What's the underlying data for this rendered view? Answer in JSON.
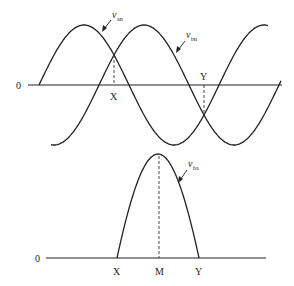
{
  "top_plot": {
    "zero_label": "0",
    "curves": [
      {
        "name": "v_an",
        "symbol": "v",
        "subscript": "an",
        "phase_deg": 0
      },
      {
        "name": "v_bn",
        "symbol": "v",
        "subscript": "bn",
        "phase_deg": -120
      }
    ],
    "markers": [
      {
        "label": "X",
        "description": "intersection of v_an and v_bn above axis"
      },
      {
        "label": "Y",
        "description": "intersection of v_an and v_bn below axis"
      }
    ]
  },
  "bottom_plot": {
    "zero_label": "0",
    "curve": {
      "name": "v_ba",
      "symbol": "v",
      "subscript": "ba"
    },
    "markers": [
      {
        "label": "X"
      },
      {
        "label": "M"
      },
      {
        "label": "Y"
      }
    ]
  }
}
